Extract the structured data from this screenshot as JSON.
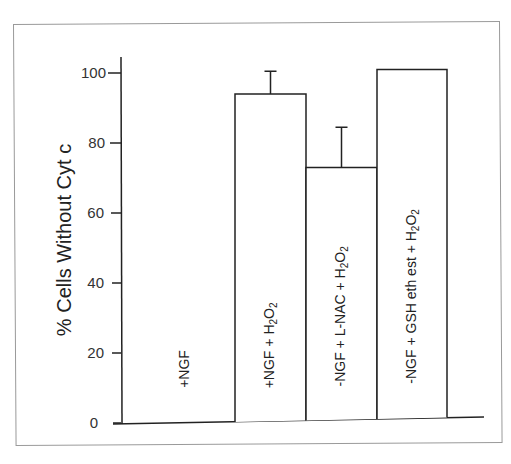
{
  "chart_data": {
    "type": "bar",
    "title": "",
    "xlabel": "",
    "ylabel": "% Cells Without Cyt c",
    "ylim": [
      0,
      100
    ],
    "yticks": [
      0,
      20,
      40,
      60,
      80,
      100
    ],
    "grid": false,
    "legend": null,
    "categories": [
      "+NGF",
      "+NGF + H2O2",
      "-NGF + L-NAC + H2O2",
      "-NGF + GSH eth est + H2O2"
    ],
    "values": [
      0,
      94,
      73,
      101
    ],
    "error_upper": [
      null,
      100.5,
      84.5,
      null
    ],
    "bar_labels_display": [
      {
        "main": "+NGF",
        "sub": ""
      },
      {
        "main": "+NGF + H",
        "sub2": "2",
        "mid": "O",
        "sub": "2"
      },
      {
        "main": "-NGF + L-NAC + H",
        "sub2": "2",
        "mid": "O",
        "sub": "2"
      },
      {
        "main": "-NGF + GSH eth est + H",
        "sub2": "2",
        "mid": "O",
        "sub": "2"
      }
    ],
    "colors": {
      "bar_fill": "#ffffff",
      "bar_stroke": "#222222",
      "axis": "#222222"
    }
  },
  "axis": {
    "ylabel": "% Cells Without Cyt c",
    "ticks": [
      "0",
      "20",
      "40",
      "60",
      "80",
      "100"
    ]
  }
}
